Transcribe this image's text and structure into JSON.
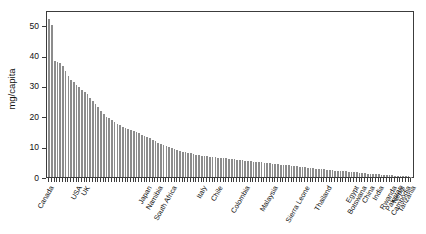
{
  "chart_data": {
    "type": "bar",
    "title": "",
    "subtitle": "",
    "xlabel": "",
    "ylabel": "mg/capita",
    "ylim": [
      0,
      55
    ],
    "yticks": [
      0,
      10,
      20,
      30,
      40,
      50
    ],
    "grid": false,
    "legend": null,
    "bar_color": "#8c8c8c",
    "axis_color": "#3c3c3c",
    "sorted": "descending",
    "n_bars": 134,
    "labeled_categories": [
      {
        "label": "Canada",
        "index": 0
      },
      {
        "label": "USA",
        "index": 10
      },
      {
        "label": "UK",
        "index": 13
      },
      {
        "label": "Japan",
        "index": 36
      },
      {
        "label": "Namibia",
        "index": 40
      },
      {
        "label": "South Africa",
        "index": 45
      },
      {
        "label": "Italy",
        "index": 56
      },
      {
        "label": "Chile",
        "index": 62
      },
      {
        "label": "Colombia",
        "index": 72
      },
      {
        "label": "Malaysia",
        "index": 82
      },
      {
        "label": "Sierra Leone",
        "index": 94
      },
      {
        "label": "Thailand",
        "index": 102
      },
      {
        "label": "Egypt",
        "index": 112
      },
      {
        "label": "Botswana",
        "index": 115
      },
      {
        "label": "China",
        "index": 118
      },
      {
        "label": "India",
        "index": 121
      },
      {
        "label": "Rwanda",
        "index": 126
      },
      {
        "label": "Pakistan",
        "index": 128
      },
      {
        "label": "Nepal",
        "index": 129
      },
      {
        "label": "Cambodia",
        "index": 131
      },
      {
        "label": "Tanzania",
        "index": 133
      }
    ],
    "categories": [
      "Canada",
      "c2",
      "c3",
      "c4",
      "c5",
      "c6",
      "c7",
      "c8",
      "c9",
      "c10",
      "USA",
      "c12",
      "c13",
      "UK",
      "c15",
      "c16",
      "c17",
      "c18",
      "c19",
      "c20",
      "c21",
      "c22",
      "c23",
      "c24",
      "c25",
      "c26",
      "c27",
      "c28",
      "c29",
      "c30",
      "c31",
      "c32",
      "c33",
      "c34",
      "c35",
      "c36",
      "Japan",
      "c38",
      "c39",
      "c40",
      "Namibia",
      "c42",
      "c43",
      "c44",
      "c45",
      "South Africa",
      "c47",
      "c48",
      "c49",
      "c50",
      "c51",
      "c52",
      "c53",
      "c54",
      "c55",
      "c56",
      "Italy",
      "c58",
      "c59",
      "c60",
      "c61",
      "c62",
      "Chile",
      "c64",
      "c65",
      "c66",
      "c67",
      "c68",
      "c69",
      "c70",
      "c71",
      "c72",
      "Colombia",
      "c74",
      "c75",
      "c76",
      "c77",
      "c78",
      "c79",
      "c80",
      "c81",
      "c82",
      "Malaysia",
      "c84",
      "c85",
      "c86",
      "c87",
      "c88",
      "c89",
      "c90",
      "c91",
      "c92",
      "c93",
      "c94",
      "Sierra Leone",
      "c96",
      "c97",
      "c98",
      "c99",
      "c100",
      "c101",
      "c102",
      "Thailand",
      "c104",
      "c105",
      "c106",
      "c107",
      "c108",
      "c109",
      "c110",
      "c111",
      "c112",
      "Egypt",
      "c114",
      "c115",
      "Botswana",
      "c117",
      "c118",
      "China",
      "c120",
      "c121",
      "India",
      "c123",
      "c124",
      "c125",
      "c126",
      "Rwanda",
      "c128",
      "Pakistan",
      "Nepal",
      "c131",
      "Cambodia",
      "c133",
      "Tanzania"
    ],
    "values": [
      52.0,
      50.2,
      38.3,
      37.9,
      37.4,
      36.6,
      35.0,
      33.4,
      32.1,
      31.2,
      30.3,
      29.6,
      28.8,
      28.0,
      27.2,
      26.0,
      25.1,
      24.2,
      23.0,
      21.8,
      20.6,
      19.9,
      19.3,
      18.7,
      18.1,
      17.6,
      17.0,
      16.6,
      16.2,
      15.9,
      15.5,
      15.2,
      14.8,
      14.4,
      14.0,
      13.6,
      13.2,
      12.8,
      12.3,
      11.8,
      11.3,
      10.9,
      10.5,
      10.1,
      9.8,
      9.5,
      9.2,
      8.9,
      8.6,
      8.4,
      8.2,
      8.0,
      7.8,
      7.6,
      7.4,
      7.2,
      7.0,
      6.9,
      6.8,
      6.7,
      6.6,
      6.5,
      6.4,
      6.3,
      6.2,
      6.1,
      6.0,
      5.9,
      5.8,
      5.7,
      5.6,
      5.5,
      5.4,
      5.3,
      5.2,
      5.1,
      5.0,
      4.9,
      4.8,
      4.7,
      4.6,
      4.5,
      4.4,
      4.3,
      4.2,
      4.1,
      4.0,
      3.9,
      3.8,
      3.7,
      3.6,
      3.5,
      3.4,
      3.3,
      3.2,
      3.1,
      3.0,
      2.9,
      2.8,
      2.7,
      2.6,
      2.5,
      2.4,
      2.3,
      2.2,
      2.1,
      2.0,
      1.95,
      1.9,
      1.85,
      1.8,
      1.7,
      1.6,
      1.5,
      1.4,
      1.3,
      1.2,
      1.1,
      1.0,
      0.95,
      0.9,
      0.85,
      0.8,
      0.7,
      0.6,
      0.55,
      0.5,
      0.45,
      0.4,
      0.35,
      0.3,
      0.25,
      0.2,
      0.15
    ]
  }
}
